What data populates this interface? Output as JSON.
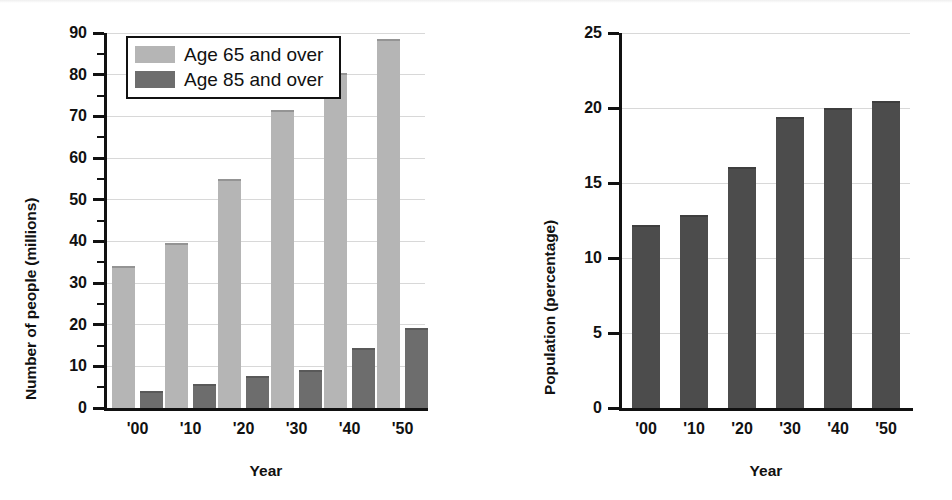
{
  "chart_data": [
    {
      "id": "older-population-counts",
      "type": "bar",
      "title": "",
      "xlabel": "Year",
      "ylabel": "Number of people (millions)",
      "categories": [
        "'00",
        "'10",
        "'20",
        "'30",
        "'40",
        "'50"
      ],
      "ylim": [
        0,
        90
      ],
      "yticks": [
        0,
        10,
        20,
        30,
        40,
        50,
        60,
        70,
        80,
        90
      ],
      "ytick_labels": [
        "0",
        "10",
        "20",
        "30",
        "40",
        "50",
        "60",
        "70",
        "80",
        "90"
      ],
      "grid": true,
      "legend_position": "top-left",
      "series": [
        {
          "name": "Age 65 and over",
          "color": "#b5b5b5",
          "values": [
            34.0,
            39.5,
            55.0,
            71.5,
            80.5,
            88.5
          ]
        },
        {
          "name": "Age 85 and over",
          "color": "#6d6d6d",
          "values": [
            4.2,
            5.8,
            7.7,
            9.2,
            14.5,
            19.3
          ]
        }
      ]
    },
    {
      "id": "older-population-percentage",
      "type": "bar",
      "title": "",
      "xlabel": "Year",
      "ylabel": "Population (percentage)",
      "categories": [
        "'00",
        "'10",
        "'20",
        "'30",
        "'40",
        "'50"
      ],
      "ylim": [
        0,
        25
      ],
      "yticks": [
        0,
        5,
        10,
        15,
        20,
        25
      ],
      "ytick_labels": [
        "0",
        "5",
        "10",
        "15",
        "20",
        "25"
      ],
      "grid": true,
      "legend_position": "none",
      "series": [
        {
          "name": "Population percentage age 65 and over",
          "color": "#4c4c4c",
          "values": [
            12.2,
            12.9,
            16.1,
            19.4,
            20.0,
            20.5
          ]
        }
      ]
    }
  ],
  "left_chart": {
    "y_axis_title": "Number of people (millions)",
    "x_axis_title": "Year",
    "legend": {
      "items": [
        {
          "label": "Age 65 and over",
          "color": "#b5b5b5"
        },
        {
          "label": "Age 85 and over",
          "color": "#6d6d6d"
        }
      ]
    }
  },
  "right_chart": {
    "y_axis_title": "Population (percentage)",
    "x_axis_title": "Year"
  }
}
